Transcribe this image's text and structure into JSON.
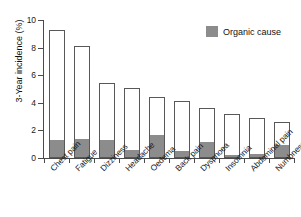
{
  "chart_data": {
    "type": "bar",
    "title": "",
    "subtitle": "",
    "xlabel": "",
    "ylabel": "3-Year incidence (%)",
    "ylim": [
      0,
      10
    ],
    "yticks": [
      0,
      2,
      4,
      6,
      8,
      10
    ],
    "ytick_labels": [
      "0",
      "2",
      "4",
      "6",
      "8",
      "10"
    ],
    "grid": false,
    "stacked": true,
    "legend_position": "top-right",
    "legend": [
      "Organic cause"
    ],
    "categories": [
      "Chest pain",
      "Fatigue",
      "Dizziness",
      "Headache",
      "Oedema",
      "Back pain",
      "Dyspnoea",
      "Insomnia",
      "Abdominal pain",
      "Numbness"
    ],
    "series": [
      {
        "name": "Total incidence",
        "color": "#ffffff",
        "values": [
          9.3,
          8.1,
          5.4,
          5.1,
          4.4,
          4.1,
          3.6,
          3.2,
          2.9,
          2.6
        ]
      },
      {
        "name": "Organic cause",
        "color": "#8c8c8c",
        "values": [
          1.2,
          1.3,
          1.2,
          0.5,
          1.6,
          0.4,
          1.1,
          0.15,
          0.2,
          0.9
        ]
      }
    ]
  },
  "legend": {
    "organic_label": "Organic cause",
    "swatch_color": "#8c8c8c"
  },
  "axes": {
    "y_title": "3-Year incidence (%)"
  }
}
